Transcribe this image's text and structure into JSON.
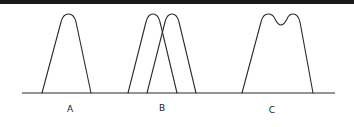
{
  "diagram": {
    "stroke_color": "#2a2a2a",
    "background_color": "#ffffff",
    "top_bar_color": "#1a1a1a",
    "panels": [
      {
        "id": "A",
        "label": "A",
        "shape": "single-peak"
      },
      {
        "id": "B",
        "label": "B",
        "shape": "two-overlapping-peaks"
      },
      {
        "id": "C",
        "label": "C",
        "shape": "merged-double-peak"
      }
    ]
  }
}
